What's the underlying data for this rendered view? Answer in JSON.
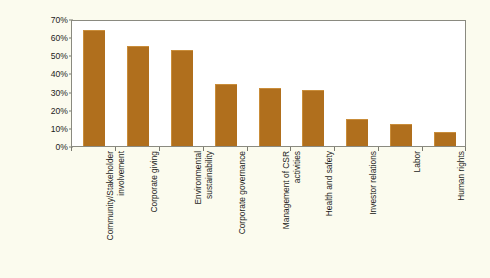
{
  "chart_data": {
    "type": "bar",
    "title": "",
    "subtitle": "",
    "xlabel": "",
    "ylabel": "Responses",
    "ylim": [
      0,
      70
    ],
    "grid": false,
    "legend": false,
    "orientation": "vertical",
    "bar_color": "#b06f1d",
    "plot_background": "#ffffff",
    "figure_background": "#fbfbee",
    "axis_color": "#8a8a80",
    "value_suffix": "%",
    "y_ticks": [
      {
        "value": 0,
        "label": "0%"
      },
      {
        "value": 10,
        "label": "10%"
      },
      {
        "value": 20,
        "label": "20%"
      },
      {
        "value": 30,
        "label": "30%"
      },
      {
        "value": 40,
        "label": "40%"
      },
      {
        "value": 50,
        "label": "50%"
      },
      {
        "value": 60,
        "label": "60%"
      },
      {
        "value": 70,
        "label": "70%"
      }
    ],
    "categories": [
      "Community/Stakeholder\ninvolvement",
      "Corporate giving",
      "Environmental\nsustainability",
      "Corporate governance",
      "Management of CSR\nactivities",
      "Health and safety",
      "Investor relations",
      "Labor",
      "Human rights"
    ],
    "values": [
      64,
      55,
      53,
      34,
      32,
      31,
      15,
      12,
      8
    ]
  }
}
